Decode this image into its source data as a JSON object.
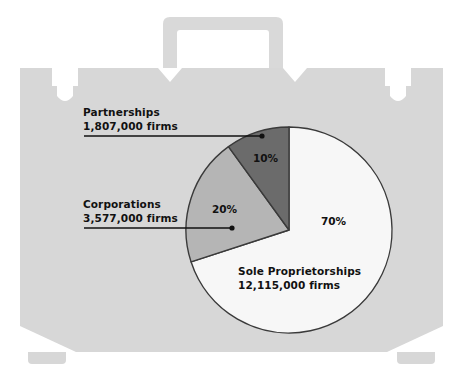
{
  "figure": {
    "background_color": "#ffffff",
    "briefcase_color": "#d7d7d7",
    "briefcase_notch_color": "#ffffff"
  },
  "chart_data": {
    "type": "pie",
    "title": "",
    "subtitle": "",
    "xlabel": "",
    "ylabel": "",
    "legend_position": "callouts",
    "grid": false,
    "start_angle_deg": 0,
    "direction": "clockwise",
    "categories": [
      "Sole Proprietorships",
      "Corporations",
      "Partnerships"
    ],
    "values": [
      70,
      20,
      10
    ],
    "value_unit": "percent",
    "counts": [
      12115000,
      3577000,
      1807000
    ],
    "count_unit": "firms",
    "slices": [
      {
        "name": "Sole Proprietorships",
        "percent": 70,
        "percent_label": "70%",
        "count": 12115000,
        "count_label": "12,115,000 firms",
        "color": "#f7f7f7",
        "stroke": "#3a3a3a",
        "label_placement": "inside",
        "callout": false
      },
      {
        "name": "Corporations",
        "percent": 20,
        "percent_label": "20%",
        "count": 3577000,
        "count_label": "3,577,000 firms",
        "color": "#b5b5b5",
        "stroke": "#3a3a3a",
        "label_placement": "callout-left",
        "callout": true
      },
      {
        "name": "Partnerships",
        "percent": 10,
        "percent_label": "10%",
        "count": 1807000,
        "count_label": "1,807,000 firms",
        "color": "#6b6b6b",
        "stroke": "#3a3a3a",
        "label_placement": "callout-left",
        "callout": true
      }
    ]
  },
  "callouts": {
    "partnerships": {
      "title": "Partnerships",
      "value": "1,807,000 firms"
    },
    "corporations": {
      "title": "Corporations",
      "value": "3,577,000 firms"
    },
    "sole_proprietorships": {
      "title": "Sole Proprietorships",
      "value": "12,115,000 firms"
    }
  },
  "percent_labels": {
    "partnerships": "10%",
    "corporations": "20%",
    "sole_proprietorships": "70%"
  }
}
